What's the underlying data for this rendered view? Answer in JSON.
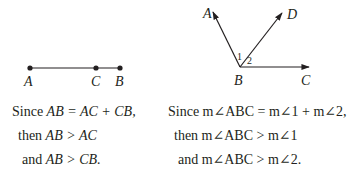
{
  "segment_figure": {
    "points": [
      {
        "label": "A",
        "x": 30,
        "y": 68
      },
      {
        "label": "C",
        "x": 96,
        "y": 68
      },
      {
        "label": "B",
        "x": 120,
        "y": 68
      }
    ]
  },
  "angle_figure": {
    "vertex": {
      "label": "B",
      "x": 240,
      "y": 67
    },
    "rays": [
      {
        "label": "A",
        "tip_x": 213,
        "tip_y": 12
      },
      {
        "label": "D",
        "tip_x": 282,
        "tip_y": 12
      },
      {
        "label": "C",
        "tip_x": 308,
        "tip_y": 67
      }
    ],
    "angle_labels": [
      "1",
      "2"
    ]
  },
  "left_text": {
    "line1_prefix": "Since ",
    "line1_math": "AB = AC + CB,",
    "line2_prefix": "then ",
    "line2_math": "AB > AC",
    "line3_prefix": "and ",
    "line3_math": "AB > CB."
  },
  "right_text": {
    "line1": "Since m∠ABC = m∠1 + m∠2,",
    "line2": "then m∠ABC > m∠1",
    "line3": "and m∠ABC > m∠2."
  },
  "colors": {
    "ink": "#231f20",
    "background": "#ffffff"
  }
}
